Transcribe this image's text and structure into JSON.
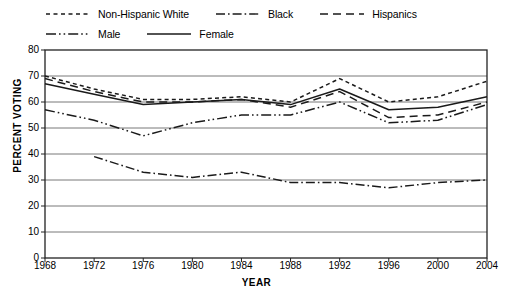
{
  "chart_data": {
    "type": "line",
    "title": "",
    "xlabel": "YEAR",
    "ylabel": "PERCENT VOTING",
    "x": [
      1968,
      1972,
      1976,
      1980,
      1984,
      1988,
      1992,
      1996,
      2000,
      2004
    ],
    "xlim": [
      1968,
      2004
    ],
    "ylim": [
      0,
      80
    ],
    "yticks": [
      0,
      10,
      20,
      30,
      40,
      50,
      60,
      70,
      80
    ],
    "xticks": [
      "1968",
      "1972",
      "1976",
      "1980",
      "1984",
      "1988",
      "1992",
      "1996",
      "2000",
      "2004"
    ],
    "grid": "horizontal",
    "legend_position": "top",
    "series": [
      {
        "name": "Non-Hispanic White",
        "style": "dotted",
        "color": "#1a1a1a",
        "values": [
          70,
          65,
          61,
          61,
          62,
          60,
          69,
          60,
          62,
          68
        ]
      },
      {
        "name": "Black",
        "style": "dash-dot-dot",
        "color": "#1a1a1a",
        "values": [
          null,
          39,
          33,
          31,
          33,
          29,
          29,
          27,
          29,
          30
        ]
      },
      {
        "name": "Hispanics",
        "style": "dashed",
        "color": "#1a1a1a",
        "values": [
          69,
          64,
          60,
          60,
          61,
          58,
          64,
          54,
          55,
          60
        ]
      },
      {
        "name": "Male",
        "style": "dash-dot",
        "color": "#1a1a1a",
        "values": [
          57,
          53,
          47,
          52,
          55,
          55,
          60,
          52,
          53,
          59
        ]
      },
      {
        "name": "Female",
        "style": "solid",
        "color": "#1a1a1a",
        "values": [
          67,
          63,
          59,
          60,
          61,
          59,
          65,
          57,
          58,
          62
        ]
      }
    ]
  },
  "legend": {
    "rows": [
      [
        {
          "label": "Non-Hispanic White",
          "style": "dotted"
        },
        {
          "label": "Black",
          "style": "dash-dot-dot"
        },
        {
          "label": "Hispanics",
          "style": "dashed"
        }
      ],
      [
        {
          "label": "Male",
          "style": "dash-dot"
        },
        {
          "label": "Female",
          "style": "solid"
        }
      ]
    ]
  }
}
